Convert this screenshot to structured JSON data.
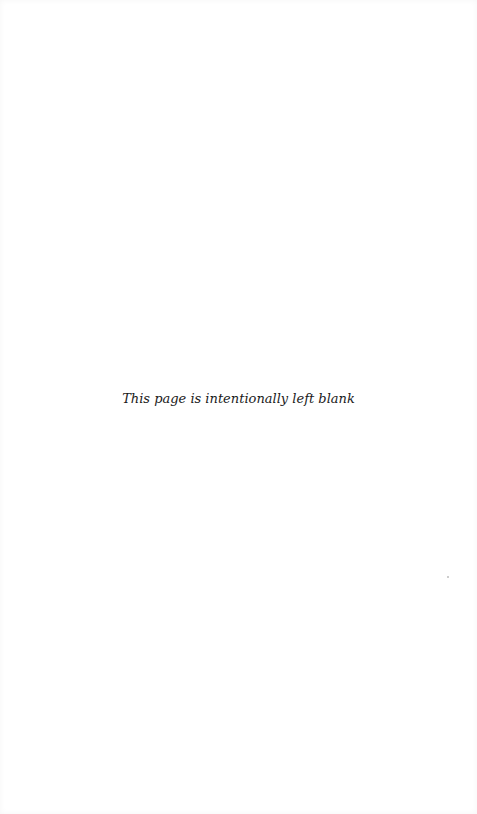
{
  "page": {
    "notice_text": "This page is intentionally left blank"
  }
}
